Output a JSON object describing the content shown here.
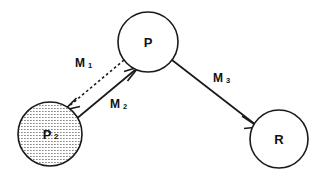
{
  "diagram": {
    "background_color": "#ffffff",
    "stroke_color": "#1a1a1a",
    "nodes": [
      {
        "id": "p",
        "label": "P",
        "subscript": "",
        "shaded": false,
        "cx": 148,
        "cy": 42,
        "r": 30
      },
      {
        "id": "p2",
        "label": "P",
        "subscript": "2",
        "shaded": true,
        "cx": 50,
        "cy": 134,
        "r": 32
      },
      {
        "id": "r",
        "label": "R",
        "subscript": "",
        "shaded": false,
        "cx": 279,
        "cy": 139,
        "r": 29
      }
    ],
    "edges": [
      {
        "id": "m1",
        "label": "M",
        "subscript": "1",
        "style": "dashed",
        "from": "p",
        "to": "p2",
        "label_x": 80,
        "label_y": 63
      },
      {
        "id": "m2",
        "label": "M",
        "subscript": "2",
        "style": "solid",
        "from": "p2",
        "to": "p",
        "label_x": 115,
        "label_y": 104
      },
      {
        "id": "m3",
        "label": "M",
        "subscript": "3",
        "style": "solid",
        "from": "p",
        "to": "r",
        "label_x": 218,
        "label_y": 78
      }
    ]
  }
}
